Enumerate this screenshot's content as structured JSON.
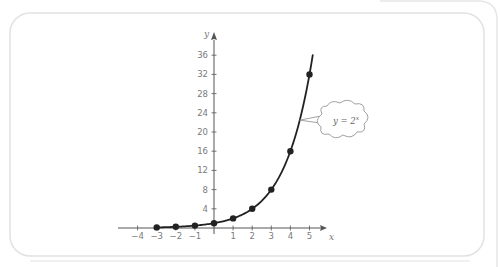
{
  "chart_data": {
    "type": "line",
    "title": "",
    "function": "y = 2^x",
    "xlabel": "x",
    "ylabel": "y",
    "xlim": [
      -4.5,
      5.8
    ],
    "ylim": [
      0,
      38
    ],
    "x_ticks": [
      -4,
      -3,
      -2,
      -1,
      1,
      2,
      3,
      4,
      5
    ],
    "x_tick_labels": [
      "−4",
      "−3",
      "−2",
      "−1",
      "1",
      "2",
      "3",
      "4",
      "5"
    ],
    "y_ticks": [
      4,
      8,
      12,
      16,
      20,
      24,
      28,
      32,
      36
    ],
    "y_tick_labels": [
      "4",
      "8",
      "12",
      "16",
      "20",
      "24",
      "28",
      "32",
      "36"
    ],
    "curve_domain": [
      -3,
      5.17
    ],
    "series": [
      {
        "name": "y = 2^x",
        "x": [
          -3,
          -2,
          -1,
          0,
          1,
          2,
          3,
          4,
          5
        ],
        "y": [
          0.125,
          0.25,
          0.5,
          1,
          2,
          4,
          8,
          16,
          32
        ]
      }
    ],
    "annotation": {
      "text_base": "y = 2",
      "text_exp": "x",
      "points_to_x": 4.49
    },
    "grid": false,
    "legend": "none",
    "colors": {
      "curve": "#222222",
      "axis": "#555555",
      "frame": "#e2e2e2",
      "labels": "#7a7a7a"
    }
  }
}
